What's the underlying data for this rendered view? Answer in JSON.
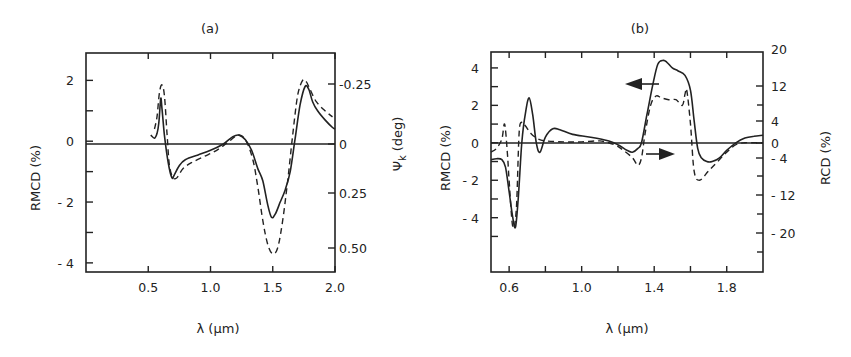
{
  "chart_data": [
    {
      "panel": "(a)",
      "type": "line",
      "title": "(a)",
      "xlabel": "λ (μm)",
      "ylabel": "RMCD (%)",
      "ylabel_right": "Ψk (deg)",
      "xlim": [
        0.0,
        2.0
      ],
      "ylim": [
        -4.3,
        2.9
      ],
      "xticks": [
        0.5,
        1.0,
        1.5,
        2.0
      ],
      "xtick_labels": [
        "0.5",
        "1.0",
        "1.5",
        "2.0"
      ],
      "yticks": [
        2,
        1,
        0,
        -1,
        -2,
        -3,
        -4
      ],
      "ytick_labels": [
        "2",
        "",
        "0",
        "",
        "-2",
        "",
        "-4"
      ],
      "yticks_right": [
        -0.25,
        0,
        0.25,
        0.5
      ],
      "ytick_right_labels": [
        "-0.25",
        "0",
        "0.25",
        "0.50"
      ],
      "right_axis_inverted": true,
      "grid": false,
      "zero_line": true,
      "series": [
        {
          "name": "RMCD",
          "style": "solid",
          "x": [
            0.52,
            0.55,
            0.57,
            0.585,
            0.6,
            0.61,
            0.63,
            0.66,
            0.69,
            0.71,
            0.75,
            0.8,
            0.9,
            1.0,
            1.1,
            1.18,
            1.23,
            1.28,
            1.33,
            1.38,
            1.42,
            1.46,
            1.49,
            1.52,
            1.56,
            1.6,
            1.64,
            1.68,
            1.72,
            1.76,
            1.79,
            1.82,
            1.86,
            1.92,
            1.98,
            2.0
          ],
          "y": [
            0.2,
            0.1,
            0.25,
            0.6,
            1.4,
            1.1,
            0.2,
            -0.7,
            -1.2,
            -1.1,
            -0.8,
            -0.6,
            -0.45,
            -0.3,
            -0.1,
            0.15,
            0.2,
            0.05,
            -0.3,
            -0.9,
            -1.3,
            -2.1,
            -2.5,
            -2.4,
            -2.0,
            -1.6,
            -1.0,
            0.1,
            1.2,
            1.8,
            1.7,
            1.3,
            1.0,
            0.7,
            0.45,
            0.4
          ]
        },
        {
          "name": "Ψk (Kerr rotation)",
          "style": "dashed",
          "x": [
            0.55,
            0.57,
            0.59,
            0.61,
            0.63,
            0.65,
            0.67,
            0.7,
            0.73,
            0.78,
            0.85,
            0.95,
            1.05,
            1.15,
            1.22,
            1.28,
            1.34,
            1.38,
            1.42,
            1.46,
            1.5,
            1.54,
            1.58,
            1.62,
            1.66,
            1.7,
            1.74,
            1.77,
            1.8,
            1.85,
            1.92,
            1.98
          ],
          "y": [
            0.4,
            0.8,
            1.6,
            1.85,
            1.5,
            0.3,
            -0.8,
            -1.2,
            -1.2,
            -0.9,
            -0.7,
            -0.5,
            -0.3,
            0.0,
            0.2,
            0.05,
            -0.6,
            -1.5,
            -2.6,
            -3.4,
            -3.7,
            -3.5,
            -2.6,
            -1.3,
            0.2,
            1.5,
            2.0,
            1.95,
            1.7,
            1.3,
            1.0,
            0.8
          ]
        }
      ]
    },
    {
      "panel": "(b)",
      "type": "line",
      "title": "(b)",
      "xlabel": "λ (μm)",
      "ylabel": "RMCD (%)",
      "ylabel_right": "RCD (%)",
      "xlim": [
        0.5,
        2.0
      ],
      "ylim": [
        -6.9,
        4.85
      ],
      "xticks": [
        0.6,
        0.8,
        1.0,
        1.2,
        1.4,
        1.6,
        1.8
      ],
      "xtick_labels": [
        "0.6",
        "",
        "1.0",
        "",
        "1.4",
        "",
        "1.8"
      ],
      "yticks": [
        4,
        3,
        2,
        1,
        0,
        -1,
        -2,
        -3,
        -4,
        -5
      ],
      "ytick_labels": [
        "4",
        "",
        "2",
        "",
        "0",
        "",
        "-2",
        "",
        "-4",
        ""
      ],
      "yticks_right": [
        20,
        12,
        4,
        0,
        -4,
        -12,
        -20
      ],
      "ytick_right_labels": [
        "20",
        "12",
        "4",
        "0",
        "-4",
        "-12",
        "-20"
      ],
      "grid": false,
      "zero_line": true,
      "annotations": [
        {
          "text": "arrow pointing left on solid curve (RMCD, left axis)",
          "x": 1.35,
          "y": 3.4
        },
        {
          "text": "arrow pointing right on dashed curve (RCD, right axis)",
          "x": 1.4,
          "y": -0.6
        }
      ],
      "series": [
        {
          "name": "RMCD",
          "style": "solid",
          "x": [
            0.5,
            0.53,
            0.56,
            0.58,
            0.6,
            0.62,
            0.635,
            0.65,
            0.67,
            0.69,
            0.71,
            0.73,
            0.75,
            0.77,
            0.8,
            0.84,
            0.88,
            0.95,
            1.05,
            1.15,
            1.2,
            1.25,
            1.28,
            1.31,
            1.33,
            1.36,
            1.39,
            1.42,
            1.45,
            1.47,
            1.5,
            1.53,
            1.57,
            1.6,
            1.62,
            1.64,
            1.66,
            1.69,
            1.72,
            1.76,
            1.8,
            1.85,
            1.9,
            1.95,
            2.0
          ],
          "y": [
            -0.9,
            -0.85,
            -0.9,
            -1.3,
            -2.6,
            -4.0,
            -4.5,
            -3.0,
            0.0,
            1.6,
            2.4,
            1.5,
            0.0,
            -0.5,
            0.3,
            0.75,
            0.7,
            0.45,
            0.3,
            0.1,
            -0.1,
            -0.4,
            -0.5,
            -0.3,
            0.0,
            1.5,
            3.0,
            4.2,
            4.4,
            4.3,
            4.0,
            3.85,
            3.6,
            2.8,
            1.2,
            -0.3,
            -0.8,
            -1.0,
            -1.0,
            -0.8,
            -0.4,
            0.0,
            0.25,
            0.35,
            0.4
          ]
        },
        {
          "name": "RCD",
          "style": "dashed",
          "x": [
            0.5,
            0.53,
            0.56,
            0.575,
            0.59,
            0.6,
            0.62,
            0.64,
            0.655,
            0.67,
            0.69,
            0.72,
            0.76,
            0.8,
            0.9,
            1.0,
            1.1,
            1.18,
            1.23,
            1.28,
            1.31,
            1.33,
            1.35,
            1.38,
            1.41,
            1.44,
            1.48,
            1.52,
            1.555,
            1.57,
            1.58,
            1.6,
            1.62,
            1.65,
            1.7,
            1.75,
            1.8,
            1.85,
            1.9,
            1.95,
            2.0
          ],
          "y": [
            -0.5,
            -0.3,
            0.2,
            1.0,
            -0.5,
            -2.0,
            -4.5,
            -3.5,
            0.5,
            1.1,
            0.9,
            0.5,
            0.2,
            0.1,
            0.05,
            0.05,
            0.1,
            -0.1,
            -0.4,
            -0.8,
            -1.2,
            -0.8,
            0.5,
            2.0,
            2.5,
            2.4,
            2.3,
            2.3,
            2.0,
            2.6,
            2.8,
            1.0,
            -1.5,
            -2.0,
            -1.5,
            -1.0,
            -0.5,
            -0.1,
            0.0,
            0.0,
            0.0
          ]
        }
      ]
    }
  ],
  "panels": {
    "a": {
      "title": "(a)",
      "xlabel": "λ (μm)",
      "ylabel": "RMCD (%)",
      "ylabel_right_main": "Ψ",
      "ylabel_right_sub": "k",
      "ylabel_right_unit": "(deg)"
    },
    "b": {
      "title": "(b)",
      "xlabel": "λ (μm)",
      "ylabel": "RMCD (%)",
      "ylabel_right": "RCD (%)"
    }
  }
}
